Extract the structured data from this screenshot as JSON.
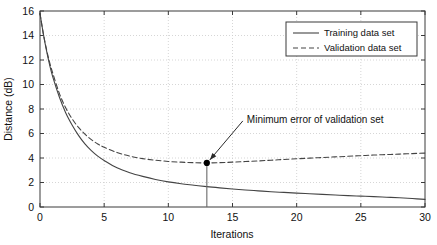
{
  "chart_data": {
    "type": "line",
    "title": "",
    "xlabel": "Iterations",
    "ylabel": "Distance (dB)",
    "xlim": [
      0,
      30
    ],
    "ylim": [
      0,
      16
    ],
    "xticks": [
      0,
      5,
      10,
      15,
      20,
      25,
      30
    ],
    "yticks": [
      0,
      2,
      4,
      6,
      8,
      10,
      12,
      14,
      16
    ],
    "xtick_labels": [
      "0",
      "5",
      "10",
      "15",
      "20",
      "25",
      "30"
    ],
    "ytick_labels": [
      "0",
      "2",
      "4",
      "6",
      "8",
      "10",
      "12",
      "14",
      "16"
    ],
    "grid": true,
    "grid_style": "dotted",
    "grid_color": "#cccccc",
    "legend_position": "top-right",
    "background": "#ffffff",
    "border_color": "#333333",
    "series": [
      {
        "name": "Training data set",
        "style": "solid",
        "color": "#444444",
        "x": [
          0,
          0.25,
          0.5,
          0.75,
          1,
          1.5,
          2,
          2.5,
          3,
          3.5,
          4,
          4.5,
          5,
          6,
          7,
          8,
          9,
          10,
          11,
          12,
          13,
          14,
          15,
          16,
          17,
          18,
          19,
          20,
          21,
          22,
          23,
          24,
          25,
          26,
          27,
          28,
          29,
          30
        ],
        "y": [
          15.8,
          14.2,
          12.8,
          11.6,
          10.6,
          9.0,
          7.7,
          6.7,
          5.85,
          5.15,
          4.6,
          4.15,
          3.8,
          3.2,
          2.8,
          2.5,
          2.25,
          2.05,
          1.9,
          1.78,
          1.66,
          1.56,
          1.47,
          1.39,
          1.32,
          1.25,
          1.19,
          1.13,
          1.08,
          1.03,
          0.98,
          0.93,
          0.89,
          0.85,
          0.8,
          0.75,
          0.69,
          0.62
        ]
      },
      {
        "name": "Validation data set",
        "style": "dashed",
        "color": "#444444",
        "x": [
          0,
          0.25,
          0.5,
          0.75,
          1,
          1.5,
          2,
          2.5,
          3,
          3.5,
          4,
          4.5,
          5,
          6,
          7,
          8,
          9,
          10,
          11,
          12,
          13,
          14,
          15,
          16,
          17,
          18,
          19,
          20,
          21,
          22,
          23,
          24,
          25,
          26,
          27,
          28,
          29,
          30
        ],
        "y": [
          15.8,
          14.2,
          12.9,
          11.8,
          10.9,
          9.3,
          8.1,
          7.2,
          6.5,
          5.95,
          5.5,
          5.15,
          4.88,
          4.45,
          4.15,
          3.95,
          3.82,
          3.72,
          3.66,
          3.62,
          3.6,
          3.62,
          3.66,
          3.71,
          3.76,
          3.82,
          3.88,
          3.94,
          3.99,
          4.04,
          4.09,
          4.14,
          4.19,
          4.24,
          4.28,
          4.32,
          4.36,
          4.4
        ]
      }
    ],
    "annotations": [
      {
        "text": "Minimum error of validation set",
        "point": {
          "x": 13,
          "y": 3.6
        },
        "marker": "filled-circle",
        "marker_color": "#000000",
        "dropline": true,
        "arrow": true
      }
    ]
  }
}
